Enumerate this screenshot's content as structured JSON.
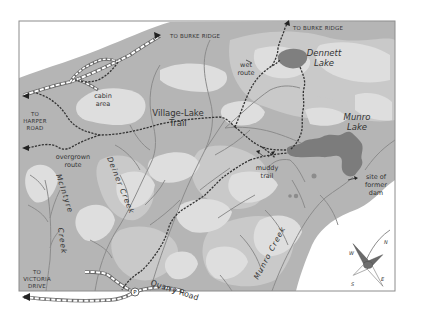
{
  "map": {
    "title": "Village-Lake Trail area map",
    "colors": {
      "background": "#ffffff",
      "land_base": "#b4b4b4",
      "land_mid": "#c8c8c8",
      "land_light": "#dcdcdc",
      "water": "#7c7c7c",
      "stream": "#8a8a8a",
      "trail": "#3a3a3a",
      "road_fill": "#ffffff",
      "road_edge": "#6a6a6a",
      "border": "#8c8c8c"
    },
    "labels": {
      "to_burke_ridge_west": "TO BURKE RIDGE",
      "to_burke_ridge_east": "TO BURKE RIDGE",
      "to_harper_road_1": "TO",
      "to_harper_road_2": "HARPER",
      "to_harper_road_3": "ROAD",
      "to_victoria_drive_1": "TO",
      "to_victoria_drive_2": "VICTORIA",
      "to_victoria_drive_3": "DRIVE",
      "cabin_area_1": "cabin",
      "cabin_area_2": "area",
      "village_lake_trail_1": "Village-Lake",
      "village_lake_trail_2": "Trail",
      "overgrown_route_1": "overgrown",
      "overgrown_route_2": "route",
      "wet_route_1": "wet",
      "wet_route_2": "route",
      "muddy_trail_1": "muddy",
      "muddy_trail_2": "trail",
      "dennett_lake_1": "Dennett",
      "dennett_lake_2": "Lake",
      "munro_lake_1": "Munro",
      "munro_lake_2": "Lake",
      "site_of_former_dam_1": "site of",
      "site_of_former_dam_2": "former",
      "site_of_former_dam_3": "dam",
      "mcintyre_creek_1": "McIntyre",
      "mcintyre_creek_2": "Creek",
      "deiner_creek": "Deiner Creek",
      "munro_creek": "Munro Creek",
      "quarry_road": "Quarry Road",
      "parking_symbol": "P"
    },
    "compass": {
      "n": "N",
      "e": "E",
      "s": "S",
      "w": "W"
    }
  }
}
